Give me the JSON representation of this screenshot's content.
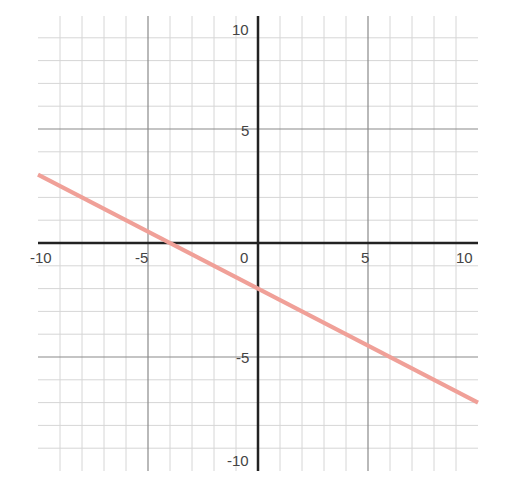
{
  "chart_data": {
    "type": "line",
    "title": "",
    "xlabel": "",
    "ylabel": "",
    "xlim": [
      -10,
      10
    ],
    "ylim": [
      -10,
      10
    ],
    "grid": true,
    "grid_step": 1,
    "x_tick_labels": [
      "-10",
      "-5",
      "0",
      "5",
      "10"
    ],
    "y_tick_labels": [
      "10",
      "5",
      "-5",
      "-10"
    ],
    "series": [
      {
        "name": "line",
        "equation": "y = -0.5x - 2",
        "slope": -0.5,
        "intercept": -2,
        "x": [
          -10,
          -4,
          0,
          10
        ],
        "y": [
          3,
          0,
          -2,
          -7
        ],
        "color": "#f0a098"
      }
    ]
  },
  "labels": {
    "x_neg10": "-10",
    "x_neg5": "-5",
    "origin": "0",
    "x_5": "5",
    "x_10": "10",
    "y_10": "10",
    "y_5": "5",
    "y_neg5": "-5",
    "y_neg10": "-10"
  },
  "colors": {
    "grid_minor": "#d6d6d6",
    "grid_major": "#8a8a8a",
    "axis": "#222222",
    "line": "#f0a098"
  }
}
